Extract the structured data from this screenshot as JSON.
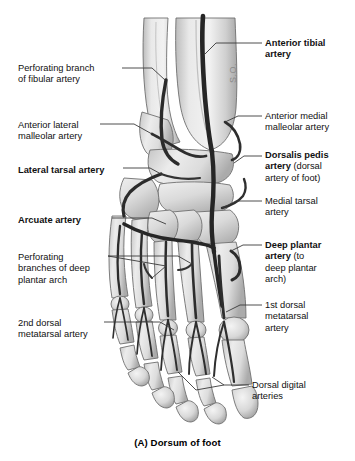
{
  "figure": {
    "caption": "(A) Dorsum of foot",
    "watermark": "S.O.",
    "colors": {
      "background": "#ffffff",
      "bone_light": "#ededed",
      "bone_mid": "#d2d2d2",
      "bone_shadow": "#a8a8a8",
      "bone_outline": "#6f6f6f",
      "artery": "#262626",
      "artery_light": "#3d3d3d",
      "leader_line": "#3a3a3a",
      "text": "#111111"
    }
  },
  "labels": {
    "left": [
      {
        "id": "perforating-branch-fibular",
        "text": "Perforating branch\nof fibular artery",
        "bold": false,
        "x": 18,
        "y": 63
      },
      {
        "id": "anterior-lateral-malleolar",
        "text": "Anterior lateral\nmalleolar artery",
        "bold": false,
        "x": 18,
        "y": 120
      },
      {
        "id": "lateral-tarsal",
        "text": "Lateral tarsal artery",
        "bold": true,
        "x": 18,
        "y": 165
      },
      {
        "id": "arcuate",
        "text": "Arcuate artery",
        "bold": true,
        "x": 18,
        "y": 215
      },
      {
        "id": "perforating-branches-deep-plantar-arch",
        "text": "Perforating\nbranches of deep\nplantar arch",
        "bold": false,
        "x": 18,
        "y": 252
      },
      {
        "id": "2nd-dorsal-metatarsal",
        "text": "2nd dorsal\nmetatarsal artery",
        "bold": false,
        "x": 18,
        "y": 318
      }
    ],
    "right": [
      {
        "id": "anterior-tibial",
        "text": "Anterior tibial\nartery",
        "bold": true,
        "x": 265,
        "y": 38
      },
      {
        "id": "anterior-medial-malleolar",
        "text": "Anterior medial\nmalleolar artery",
        "bold": false,
        "x": 265,
        "y": 111
      },
      {
        "id": "dorsalis-pedis",
        "bold_part": "Dorsalis pedis\nartery",
        "normal_part": " (dorsal\nartery of foot)",
        "x": 265,
        "y": 150
      },
      {
        "id": "medial-tarsal",
        "text": "Medial tarsal\nartery",
        "bold": false,
        "x": 265,
        "y": 196
      },
      {
        "id": "deep-plantar",
        "bold_part": "Deep plantar\nartery",
        "normal_part": " (to\ndeep plantar\narch)",
        "x": 265,
        "y": 240
      },
      {
        "id": "1st-dorsal-metatarsal",
        "text": "1st dorsal\nmetatarsal\nartery",
        "bold": false,
        "x": 265,
        "y": 300
      },
      {
        "id": "dorsal-digital",
        "text": "Dorsal digital\narteries",
        "bold": false,
        "x": 252,
        "y": 380
      }
    ]
  },
  "leaders": [
    {
      "id": "leader-anterior-tibial",
      "points": "262,43 216,43 205,54"
    },
    {
      "id": "leader-perforating-fibular",
      "points": "122,68 152,68 165,80"
    },
    {
      "id": "leader-anterior-medial-malleolar",
      "points": "262,116 238,116 225,122"
    },
    {
      "id": "leader-anterior-lateral-malleolar",
      "points": "100,124 134,124 152,134"
    },
    {
      "id": "leader-dorsalis-pedis",
      "points": "262,156 244,156 234,163"
    },
    {
      "id": "leader-lateral-tarsal",
      "points": "123,168 150,168 161,174"
    },
    {
      "id": "leader-medial-tarsal",
      "points": "262,201 236,201 222,208"
    },
    {
      "id": "leader-arcuate",
      "points": "112,218 152,218 166,224"
    },
    {
      "id": "leader-deep-plantar",
      "points": "262,245 243,245 231,251"
    },
    {
      "id": "leader-perforating-deep-1",
      "points": "108,256 178,256 192,264"
    },
    {
      "id": "leader-perforating-deep-2",
      "points": "108,256 166,266 152,278"
    },
    {
      "id": "leader-1st-dorsal-metatarsal",
      "points": "262,305 240,305 226,312"
    },
    {
      "id": "leader-2nd-dorsal-metatarsal",
      "points": "104,322 160,322 174,330"
    },
    {
      "id": "leader-dorsal-digital-1",
      "points": "249,385 224,385 212,377"
    },
    {
      "id": "leader-dorsal-digital-2",
      "points": "224,385 196,390 178,372"
    }
  ],
  "anatomy": {
    "bones": [
      {
        "id": "tibia",
        "label": "tibia"
      },
      {
        "id": "fibula",
        "label": "fibula"
      },
      {
        "id": "talus",
        "label": "talus"
      },
      {
        "id": "navicular",
        "label": "navicular"
      },
      {
        "id": "cuneiforms",
        "label": "cuneiforms"
      },
      {
        "id": "cuboid",
        "label": "cuboid"
      },
      {
        "id": "metatarsals",
        "label": "metatarsals"
      },
      {
        "id": "phalanges",
        "label": "phalanges"
      }
    ],
    "arteries": [
      {
        "id": "anterior-tibial-artery",
        "label": "Anterior tibial artery"
      },
      {
        "id": "dorsalis-pedis-artery",
        "label": "Dorsalis pedis artery"
      },
      {
        "id": "arcuate-artery",
        "label": "Arcuate artery"
      },
      {
        "id": "lateral-tarsal-artery",
        "label": "Lateral tarsal artery"
      },
      {
        "id": "medial-tarsal-artery",
        "label": "Medial tarsal artery"
      },
      {
        "id": "perforating-branch-of-fibular-artery",
        "label": "Perforating branch of fibular artery"
      },
      {
        "id": "deep-plantar-artery",
        "label": "Deep plantar artery"
      },
      {
        "id": "dorsal-metatarsal-arteries",
        "label": "Dorsal metatarsal arteries"
      },
      {
        "id": "dorsal-digital-arteries",
        "label": "Dorsal digital arteries"
      }
    ]
  }
}
